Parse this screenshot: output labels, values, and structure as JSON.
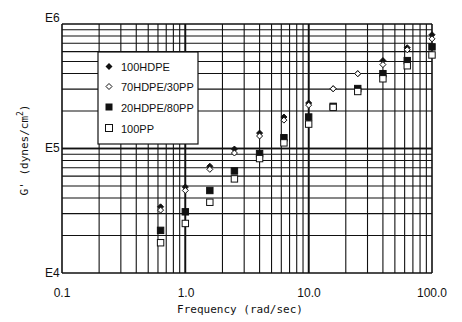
{
  "chart_data": {
    "type": "scatter",
    "title": "",
    "xlabel": "Frequency (rad/sec)",
    "ylabel": "G' (dynes/cm2)",
    "xscale": "log",
    "yscale": "log",
    "xlim": [
      0.1,
      100.0
    ],
    "ylim": [
      10000,
      1000000
    ],
    "x_tick_labels": [
      "0.1",
      "1.0",
      "10.0",
      "100.0"
    ],
    "y_tick_labels": [
      "E4",
      "E5",
      "E6"
    ],
    "grid": true,
    "legend_position": "upper-left inside",
    "x": [
      0.63,
      1.0,
      1.58,
      2.5,
      4.0,
      6.3,
      10.0,
      15.8,
      25.0,
      40.0,
      63.0,
      100.0
    ],
    "series": [
      {
        "name": "100HDPE",
        "marker": "filled-diamond",
        "values": [
          34000,
          49000,
          72000,
          99000,
          133000,
          179000,
          232000,
          302000,
          399000,
          508000,
          645000,
          820000
        ]
      },
      {
        "name": "70HDPE/30PP",
        "marker": "open-diamond",
        "values": [
          32000,
          46000,
          68000,
          92000,
          126000,
          169000,
          223000,
          302000,
          399000,
          472000,
          621000,
          760000
        ]
      },
      {
        "name": "20HDPE/80PP",
        "marker": "filled-square",
        "values": [
          22000,
          31000,
          46000,
          66000,
          91000,
          122000,
          179000,
          218000,
          303000,
          399000,
          508000,
          655000
        ]
      },
      {
        "name": "100PP",
        "marker": "open-square",
        "values": [
          17500,
          25000,
          37000,
          57000,
          83000,
          111000,
          157000,
          214000,
          287000,
          363000,
          462000,
          564000
        ]
      }
    ]
  },
  "axes": {
    "x_title": "Frequency (rad/sec)",
    "y_title_main": "G' (dynes/cm",
    "y_title_sup": "2",
    "y_title_end": ")",
    "x_ticks": [
      "0.1",
      "1.0",
      "10.0",
      "100.0"
    ],
    "y_ticks": [
      "E4",
      "E5",
      "E6"
    ]
  },
  "legend": {
    "items": [
      {
        "label": "100HDPE",
        "marker": "filled-diamond"
      },
      {
        "label": "70HDPE/30PP",
        "marker": "open-diamond"
      },
      {
        "label": "20HDPE/80PP",
        "marker": "filled-square"
      },
      {
        "label": "100PP",
        "marker": "open-square"
      }
    ]
  }
}
